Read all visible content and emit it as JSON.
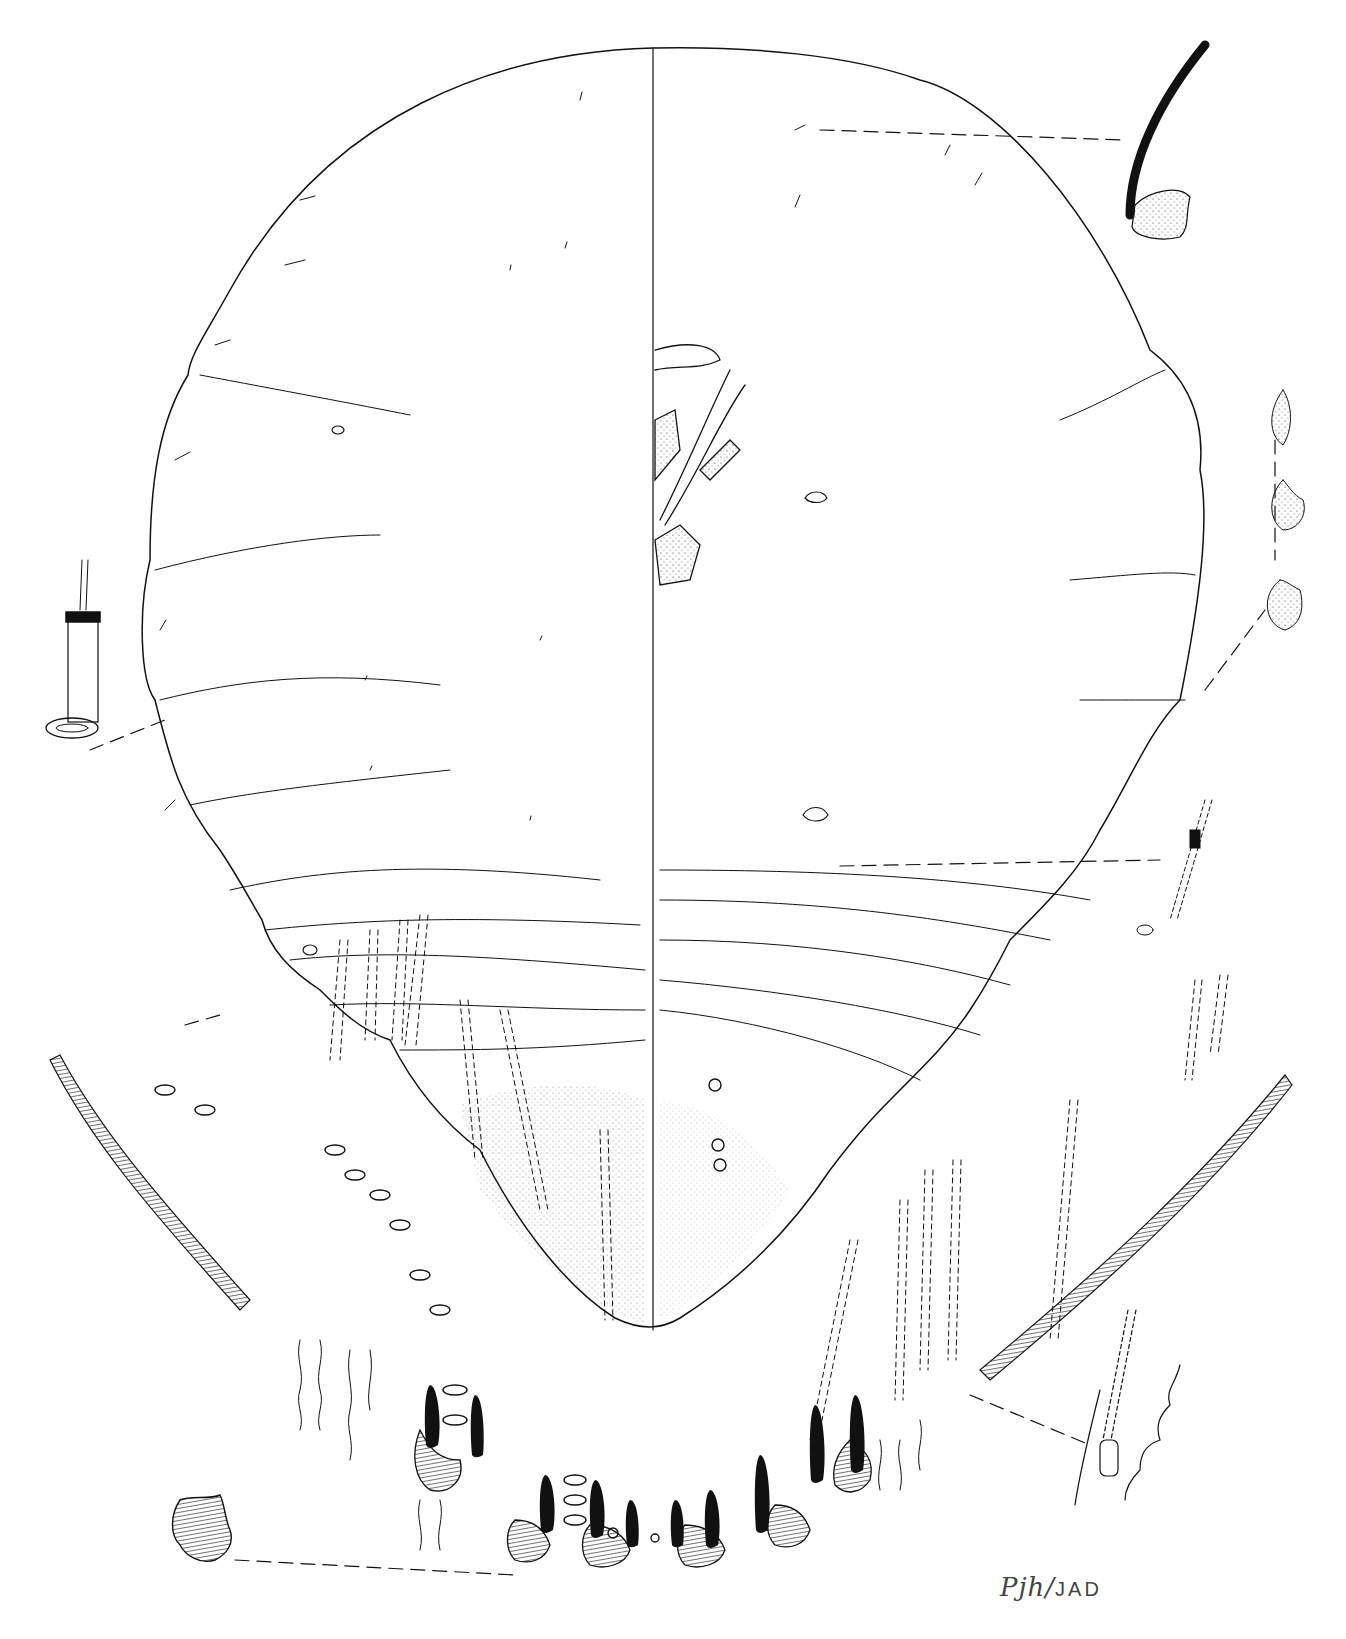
{
  "figure": {
    "type": "scientific-illustration",
    "layout": "left half dorsum, right half venter, with enlarged detail insets of setae, pores and marginal fringe",
    "line_color": "#111111",
    "background": "#ffffff"
  },
  "insets": [
    {
      "name": "dorsal-seta-detail",
      "position": "top-right"
    },
    {
      "name": "tubular-duct-detail",
      "position": "left-middle"
    },
    {
      "name": "ventral-pore-details",
      "position": "right-middle",
      "count": 3
    },
    {
      "name": "ventral-duct-detail",
      "position": "right-middle-lower"
    },
    {
      "name": "marginal-fringe-left",
      "position": "lower-left"
    },
    {
      "name": "marginal-fringe-right",
      "position": "lower-right"
    },
    {
      "name": "fringe-plate-detail",
      "position": "bottom-left"
    },
    {
      "name": "fringe-process-detail",
      "position": "bottom-right"
    }
  ],
  "signature": {
    "initials": "Pjh",
    "separator": "/",
    "coauthor": "JAD"
  }
}
